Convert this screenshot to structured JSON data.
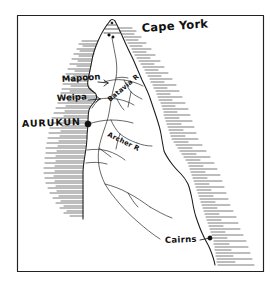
{
  "map": {
    "title": "Cape York Peninsula",
    "style": "hand-drawn pen sketch",
    "ink_color": "#1a1a1a",
    "background_color": "#ffffff",
    "frame": {
      "present": true,
      "left": 17,
      "top": 15,
      "right": 264,
      "bottom": 272
    },
    "labels": {
      "cape_york": "Cape York",
      "mapoon": "Mapoon",
      "weipa": "Weipa",
      "aurukun": "AURUKUN",
      "cairns": "Cairns",
      "river_batavia": "Batavia R",
      "river_archer": "Archer R"
    },
    "markers": [
      {
        "name": "aurukun",
        "label": "AURUKUN",
        "type": "major-settlement",
        "x": 88,
        "y": 124
      },
      {
        "name": "mapoon",
        "label": "Mapoon",
        "type": "settlement",
        "x": 104,
        "y": 82
      },
      {
        "name": "weipa",
        "label": "Weipa",
        "type": "settlement",
        "x": 99,
        "y": 99
      },
      {
        "name": "cairns",
        "label": "Cairns",
        "type": "city",
        "x": 207,
        "y": 239
      }
    ]
  }
}
